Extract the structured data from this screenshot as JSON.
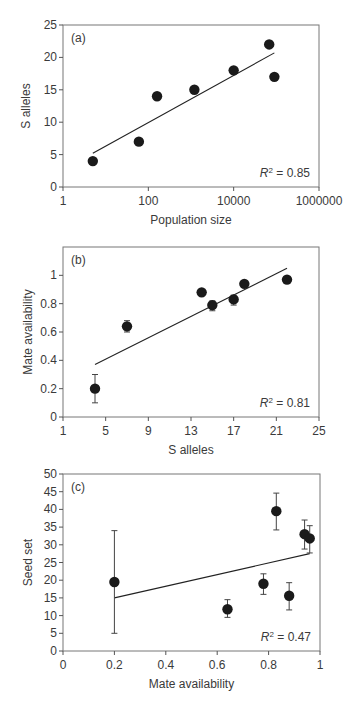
{
  "figure": {
    "panels": [
      "(a)",
      "(b)",
      "(c)"
    ]
  },
  "chart_data": [
    {
      "type": "scatter",
      "panel_label": "(a)",
      "title": "",
      "xlabel": "Population size",
      "ylabel": "S alleles",
      "xscale": "log",
      "xlim": [
        1,
        1000000
      ],
      "ylim": [
        0,
        25
      ],
      "xticks": [
        1,
        100,
        10000,
        1000000
      ],
      "xtick_labels": [
        "1",
        "100",
        "10000",
        "1000000"
      ],
      "yticks": [
        0,
        5,
        10,
        15,
        20,
        25
      ],
      "ytick_labels": [
        "0",
        "5",
        "10",
        "15",
        "20",
        "25"
      ],
      "grid": false,
      "annotation": {
        "text_prefix": "R",
        "sup": "2",
        "text_suffix": " = 0.85",
        "r2": 0.85
      },
      "points": [
        {
          "x": 5,
          "y": 4
        },
        {
          "x": 60,
          "y": 7
        },
        {
          "x": 160,
          "y": 14
        },
        {
          "x": 1200,
          "y": 15
        },
        {
          "x": 10000,
          "y": 18
        },
        {
          "x": 68000,
          "y": 22
        },
        {
          "x": 90000,
          "y": 17
        }
      ],
      "fit_line": {
        "x": [
          5,
          90000
        ],
        "y": [
          5.2,
          20.7
        ]
      }
    },
    {
      "type": "scatter",
      "panel_label": "(b)",
      "title": "",
      "xlabel": "S alleles",
      "ylabel": "Mate availability",
      "xscale": "linear",
      "xlim": [
        1,
        25
      ],
      "ylim": [
        0,
        1.2
      ],
      "xticks": [
        1,
        5,
        9,
        13,
        17,
        21,
        25
      ],
      "xtick_labels": [
        "1",
        "5",
        "9",
        "13",
        "17",
        "21",
        "25"
      ],
      "yticks": [
        0,
        0.2,
        0.4,
        0.6,
        0.8,
        1
      ],
      "ytick_labels": [
        "0",
        "0.2",
        "0.4",
        "0.6",
        "0.8",
        "1"
      ],
      "grid": false,
      "annotation": {
        "text_prefix": "R",
        "sup": "2",
        "text_suffix": " = 0.81",
        "r2": 0.81
      },
      "points": [
        {
          "x": 4,
          "y": 0.2,
          "err_low": 0.1,
          "err_high": 0.3
        },
        {
          "x": 7,
          "y": 0.64,
          "err_low": 0.6,
          "err_high": 0.68
        },
        {
          "x": 14,
          "y": 0.88
        },
        {
          "x": 15,
          "y": 0.79,
          "err_low": 0.75,
          "err_high": 0.82
        },
        {
          "x": 17,
          "y": 0.83,
          "err_low": 0.79,
          "err_high": 0.86
        },
        {
          "x": 18,
          "y": 0.94
        },
        {
          "x": 22,
          "y": 0.97
        }
      ],
      "fit_line": {
        "x": [
          4,
          22
        ],
        "y": [
          0.37,
          1.05
        ]
      }
    },
    {
      "type": "scatter",
      "panel_label": "(c)",
      "title": "",
      "xlabel": "Mate availability",
      "ylabel": "Seed set",
      "xscale": "linear",
      "xlim": [
        0,
        1
      ],
      "ylim": [
        0,
        50
      ],
      "xticks": [
        0,
        0.2,
        0.4,
        0.6,
        0.8,
        1
      ],
      "xtick_labels": [
        "0",
        "0.2",
        "0.4",
        "0.6",
        "0.8",
        "1"
      ],
      "yticks": [
        0,
        5,
        10,
        15,
        20,
        25,
        30,
        35,
        40,
        45,
        50
      ],
      "ytick_labels": [
        "0",
        "5",
        "10",
        "15",
        "20",
        "25",
        "30",
        "35",
        "40",
        "45",
        "50"
      ],
      "grid": false,
      "annotation": {
        "text_prefix": "R",
        "sup": "2",
        "text_suffix": " = 0.47",
        "r2": 0.47
      },
      "points": [
        {
          "x": 0.2,
          "y": 19.5,
          "err_low": 5,
          "err_high": 34
        },
        {
          "x": 0.64,
          "y": 11.8,
          "err_low": 9.5,
          "err_high": 14.5
        },
        {
          "x": 0.78,
          "y": 19,
          "err_low": 16,
          "err_high": 21.8
        },
        {
          "x": 0.83,
          "y": 39.5,
          "err_low": 34.2,
          "err_high": 44.6
        },
        {
          "x": 0.88,
          "y": 15.6,
          "err_low": 11.6,
          "err_high": 19.3
        },
        {
          "x": 0.94,
          "y": 33,
          "err_low": 28.8,
          "err_high": 37
        },
        {
          "x": 0.96,
          "y": 31.8,
          "err_low": 27.7,
          "err_high": 35.4
        }
      ],
      "fit_line": {
        "x": [
          0.2,
          0.96
        ],
        "y": [
          15,
          27.5
        ]
      }
    }
  ]
}
